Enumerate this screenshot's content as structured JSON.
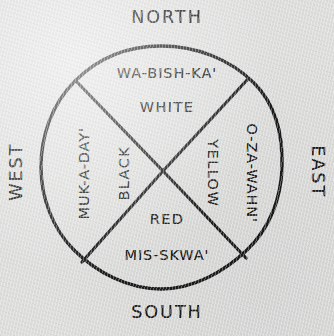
{
  "diagram": {
    "type": "four-quadrant-circle",
    "stroke_color": "#1b1b1b",
    "background_color": "#dddedc",
    "circle": {
      "center_x": 161,
      "center_y": 167,
      "radius": 121
    },
    "cardinals": {
      "north": "NORTH",
      "south": "SOUTH",
      "east": "EAST",
      "west": "WEST"
    },
    "quadrants": {
      "north": {
        "name": "WA-BISH-KA'",
        "color": "WHITE"
      },
      "east": {
        "name": "O-ZA-WAHN'",
        "color": "YELLOW"
      },
      "south": {
        "name": "MIS-SKWA'",
        "color": "RED"
      },
      "west": {
        "name": "MUK-A-DAY'",
        "color": "BLACK"
      }
    }
  }
}
